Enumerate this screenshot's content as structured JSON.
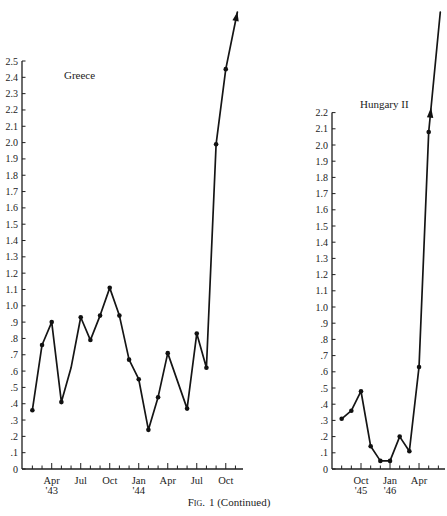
{
  "caption": {
    "label": "Fig.",
    "text": "1 (Continued)"
  },
  "chart_data": [
    {
      "type": "line",
      "title": "Greece",
      "xlabel": "",
      "ylabel": "",
      "ylim": [
        0,
        2.5
      ],
      "grid": false,
      "legend": null,
      "yticks": [
        0,
        0.1,
        0.2,
        0.3,
        0.4,
        0.5,
        0.6,
        0.7,
        0.8,
        0.9,
        1.0,
        1.1,
        1.2,
        1.3,
        1.4,
        1.5,
        1.6,
        1.7,
        1.8,
        1.9,
        2.0,
        2.1,
        2.2,
        2.3,
        2.4,
        2.5
      ],
      "ytick_labels": [
        "0",
        ".1",
        ".2",
        ".3",
        ".4",
        ".5",
        ".6",
        ".7",
        ".8",
        ".9",
        "1.0",
        "1.1",
        "1.2",
        "1.3",
        "1.4",
        "1.5",
        "1.6",
        "1.7",
        "1.8",
        "1.9",
        "2.0",
        "2.1",
        "2.2",
        "2.3",
        "2.4",
        "2.5"
      ],
      "months": [
        "Jan '43",
        "Feb '43",
        "Mar '43",
        "Apr '43",
        "May '43",
        "Jun '43",
        "Jul '43",
        "Aug '43",
        "Sep '43",
        "Oct '43",
        "Nov '43",
        "Dec '43",
        "Jan '44",
        "Feb '44",
        "Mar '44",
        "Apr '44",
        "May '44",
        "Jun '44",
        "Jul '44",
        "Aug '44",
        "Sep '44",
        "Oct '44",
        "Nov '44"
      ],
      "xtick_labels": [
        {
          "month": "Apr '43",
          "label": "Apr",
          "sub": "'43"
        },
        {
          "month": "Jul '43",
          "label": "Jul",
          "sub": ""
        },
        {
          "month": "Oct '43",
          "label": "Oct",
          "sub": ""
        },
        {
          "month": "Jan '44",
          "label": "Jan",
          "sub": "'44"
        },
        {
          "month": "Apr '44",
          "label": "Apr",
          "sub": ""
        },
        {
          "month": "Jul '44",
          "label": "Jul",
          "sub": ""
        },
        {
          "month": "Oct '44",
          "label": "Oct",
          "sub": ""
        }
      ],
      "series": [
        {
          "name": "Greece",
          "continues_off_scale": true,
          "off_scale_arrow": "at_tip",
          "points": [
            {
              "month": "Feb '43",
              "value": 0.36
            },
            {
              "month": "Mar '43",
              "value": 0.76
            },
            {
              "month": "Apr '43",
              "value": 0.9
            },
            {
              "month": "May '43",
              "value": 0.41
            },
            {
              "month": "Jun '43",
              "value": 0.62,
              "marker": false
            },
            {
              "month": "Jul '43",
              "value": 0.93
            },
            {
              "month": "Aug '43",
              "value": 0.79
            },
            {
              "month": "Sep '43",
              "value": 0.94
            },
            {
              "month": "Oct '43",
              "value": 1.11
            },
            {
              "month": "Nov '43",
              "value": 0.94
            },
            {
              "month": "Dec '43",
              "value": 0.67
            },
            {
              "month": "Jan '44",
              "value": 0.55
            },
            {
              "month": "Feb '44",
              "value": 0.24
            },
            {
              "month": "Mar '44",
              "value": 0.44
            },
            {
              "month": "Apr '44",
              "value": 0.71
            },
            {
              "month": "Jun '44",
              "value": 0.37
            },
            {
              "month": "Jul '44",
              "value": 0.83
            },
            {
              "month": "Aug '44",
              "value": 0.62
            },
            {
              "month": "Sep '44",
              "value": 1.99
            },
            {
              "month": "Oct '44",
              "value": 2.45
            }
          ]
        }
      ]
    },
    {
      "type": "line",
      "title": "Hungary II",
      "xlabel": "",
      "ylabel": "",
      "ylim": [
        0,
        2.2
      ],
      "grid": false,
      "legend": null,
      "yticks": [
        0,
        0.1,
        0.2,
        0.3,
        0.4,
        0.5,
        0.6,
        0.7,
        0.8,
        0.9,
        1.0,
        1.1,
        1.2,
        1.3,
        1.4,
        1.5,
        1.6,
        1.7,
        1.8,
        1.9,
        2.0,
        2.1,
        2.2
      ],
      "ytick_labels": [
        "0",
        ".1",
        ".2",
        ".3",
        ".4",
        ".5",
        ".6",
        ".7",
        ".8",
        ".9",
        "1.0",
        "1.1",
        "1.2",
        "1.3",
        "1.4",
        "1.5",
        "1.6",
        "1.7",
        "1.8",
        "1.9",
        "2.0",
        "2.1",
        "2.2"
      ],
      "months": [
        "Jul '45",
        "Aug '45",
        "Sep '45",
        "Oct '45",
        "Nov '45",
        "Dec '45",
        "Jan '46",
        "Feb '46",
        "Mar '46",
        "Apr '46",
        "May '46",
        "Jun '46"
      ],
      "xtick_labels": [
        {
          "month": "Oct '45",
          "label": "Oct",
          "sub": "'45"
        },
        {
          "month": "Jan '46",
          "label": "Jan",
          "sub": "'46"
        },
        {
          "month": "Apr '46",
          "label": "Apr",
          "sub": ""
        }
      ],
      "series": [
        {
          "name": "Hungary II",
          "continues_off_scale": true,
          "off_scale_arrow": "at_axis_max",
          "points": [
            {
              "month": "Aug '45",
              "value": 0.31
            },
            {
              "month": "Sep '45",
              "value": 0.36
            },
            {
              "month": "Oct '45",
              "value": 0.48
            },
            {
              "month": "Nov '45",
              "value": 0.14
            },
            {
              "month": "Dec '45",
              "value": 0.05
            },
            {
              "month": "Jan '46",
              "value": 0.05
            },
            {
              "month": "Feb '46",
              "value": 0.2
            },
            {
              "month": "Mar '46",
              "value": 0.11
            },
            {
              "month": "Apr '46",
              "value": 0.63
            },
            {
              "month": "May '46",
              "value": 2.08
            }
          ]
        }
      ]
    }
  ]
}
